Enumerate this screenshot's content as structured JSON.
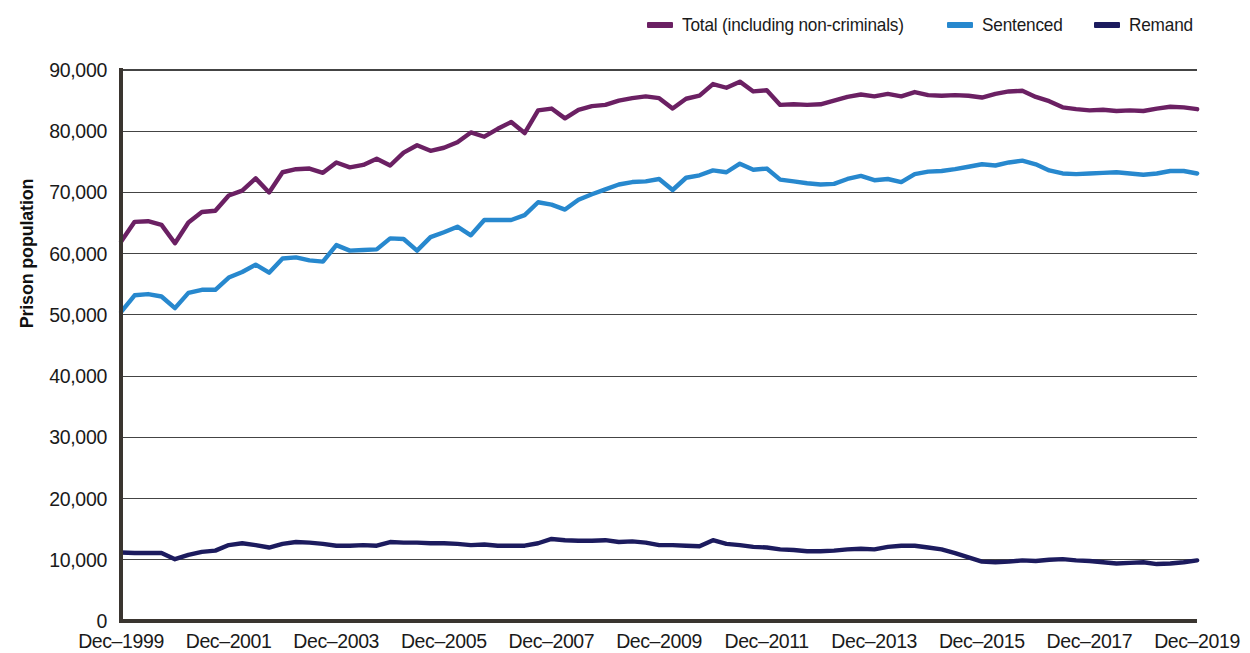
{
  "chart_data": {
    "type": "line",
    "title": "",
    "subtitle": "",
    "xlabel": "",
    "ylabel": "Prison population",
    "ylim": [
      0,
      90000
    ],
    "xlim": [
      "Dec-1999",
      "Dec-2019"
    ],
    "grid": true,
    "legend_position": "top-right",
    "y_ticks": [
      "0",
      "10,000",
      "20,000",
      "30,000",
      "40,000",
      "50,000",
      "60,000",
      "70,000",
      "80,000",
      "90,000"
    ],
    "y_tick_values": [
      0,
      10000,
      20000,
      30000,
      40000,
      50000,
      60000,
      70000,
      80000,
      90000
    ],
    "x_ticks": [
      "Dec–1999",
      "Dec–2001",
      "Dec–2003",
      "Dec–2005",
      "Dec–2007",
      "Dec–2009",
      "Dec–2011",
      "Dec–2013",
      "Dec–2015",
      "Dec–2017",
      "Dec–2019"
    ],
    "x_tick_values": [
      1999.917,
      2001.917,
      2003.917,
      2005.917,
      2007.917,
      2009.917,
      2011.917,
      2013.917,
      2015.917,
      2017.917,
      2019.917
    ],
    "x": [
      1999.92,
      2000.17,
      2000.42,
      2000.67,
      2000.92,
      2001.17,
      2001.42,
      2001.67,
      2001.92,
      2002.17,
      2002.42,
      2002.67,
      2002.92,
      2003.17,
      2003.42,
      2003.67,
      2003.92,
      2004.17,
      2004.42,
      2004.67,
      2004.92,
      2005.17,
      2005.42,
      2005.67,
      2005.92,
      2006.17,
      2006.42,
      2006.67,
      2006.92,
      2007.17,
      2007.42,
      2007.67,
      2007.92,
      2008.17,
      2008.42,
      2008.67,
      2008.92,
      2009.17,
      2009.42,
      2009.67,
      2009.92,
      2010.17,
      2010.42,
      2010.67,
      2010.92,
      2011.17,
      2011.42,
      2011.67,
      2011.92,
      2012.17,
      2012.42,
      2012.67,
      2012.92,
      2013.17,
      2013.42,
      2013.67,
      2013.92,
      2014.17,
      2014.42,
      2014.67,
      2014.92,
      2015.17,
      2015.42,
      2015.67,
      2015.92,
      2016.17,
      2016.42,
      2016.67,
      2016.92,
      2017.17,
      2017.42,
      2017.67,
      2017.92,
      2018.17,
      2018.42,
      2018.67,
      2018.92,
      2019.17,
      2019.42,
      2019.67,
      2019.92
    ],
    "series": [
      {
        "name": "Total (including non-criminals)",
        "color": "#6B2063",
        "values": [
          62000,
          65200,
          65300,
          64700,
          61700,
          65100,
          66800,
          67000,
          69500,
          70300,
          72300,
          70000,
          73300,
          73800,
          73900,
          73200,
          74900,
          74100,
          74500,
          75500,
          74400,
          76500,
          77700,
          76800,
          77300,
          78200,
          79800,
          79100,
          80400,
          81500,
          79700,
          83400,
          83700,
          82100,
          83500,
          84100,
          84300,
          85000,
          85400,
          85700,
          85400,
          83700,
          85300,
          85800,
          87700,
          87100,
          88100,
          86500,
          86700,
          84300,
          84400,
          84300,
          84400,
          85000,
          85600,
          86000,
          85700,
          86100,
          85700,
          86400,
          85900,
          85800,
          85900,
          85800,
          85500,
          86100,
          86500,
          86600,
          85600,
          84900,
          83900,
          83600,
          83400,
          83500,
          83300,
          83400,
          83300,
          83700,
          84000,
          83900,
          83600
        ]
      },
      {
        "name": "Sentenced",
        "color": "#2788CE",
        "values": [
          50500,
          53200,
          53400,
          53000,
          51100,
          53600,
          54100,
          54100,
          56100,
          57000,
          58200,
          56900,
          59200,
          59400,
          58900,
          58700,
          61400,
          60500,
          60600,
          60700,
          62500,
          62400,
          60500,
          62700,
          63500,
          64400,
          63000,
          65500,
          65500,
          65500,
          66300,
          68400,
          68000,
          67200,
          68800,
          69700,
          70500,
          71300,
          71700,
          71800,
          72200,
          70400,
          72400,
          72800,
          73600,
          73300,
          74700,
          73700,
          73900,
          72100,
          71800,
          71500,
          71300,
          71400,
          72200,
          72700,
          72000,
          72200,
          71700,
          73000,
          73400,
          73500,
          73800,
          74200,
          74600,
          74400,
          74900,
          75200,
          74600,
          73600,
          73100,
          73000,
          73100,
          73200,
          73300,
          73100,
          72900,
          73100,
          73500,
          73500,
          73100
        ]
      },
      {
        "name": "Remand",
        "color": "#1C1B5E",
        "values": [
          11200,
          11100,
          11100,
          11100,
          10100,
          10800,
          11300,
          11500,
          12400,
          12700,
          12400,
          12000,
          12600,
          12900,
          12800,
          12600,
          12300,
          12300,
          12400,
          12300,
          12900,
          12800,
          12800,
          12700,
          12700,
          12600,
          12400,
          12500,
          12300,
          12300,
          12300,
          12700,
          13400,
          13200,
          13100,
          13100,
          13200,
          12900,
          13000,
          12800,
          12400,
          12400,
          12300,
          12200,
          13200,
          12600,
          12400,
          12100,
          12000,
          11700,
          11600,
          11400,
          11400,
          11500,
          11700,
          11800,
          11700,
          12100,
          12300,
          12300,
          12000,
          11700,
          11100,
          10400,
          9700,
          9600,
          9700,
          9900,
          9800,
          10000,
          10100,
          9900,
          9800,
          9600,
          9400,
          9500,
          9600,
          9300,
          9400,
          9600,
          9900
        ]
      }
    ]
  },
  "legend": {
    "items": [
      {
        "label": "Total (including non-criminals)",
        "color": "#6B2063"
      },
      {
        "label": "Sentenced",
        "color": "#2788CE"
      },
      {
        "label": "Remand",
        "color": "#1C1B5E"
      }
    ]
  },
  "axes": {
    "y_title": "Prison population"
  }
}
